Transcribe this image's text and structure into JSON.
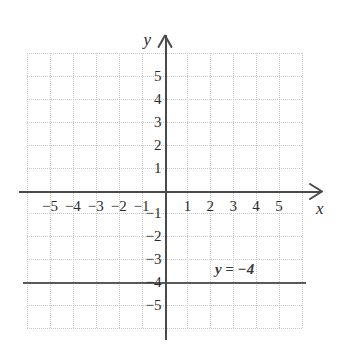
{
  "chart_data": {
    "type": "line",
    "title": "",
    "xlabel": "x",
    "ylabel": "y",
    "xlim": [
      -6,
      6
    ],
    "ylim": [
      -6,
      6
    ],
    "grid": true,
    "legend": "none",
    "x_tick_labels": [
      "−5",
      "−4",
      "−3",
      "−2",
      "−1",
      "1",
      "2",
      "3",
      "4",
      "5"
    ],
    "x_tick_values": [
      -5,
      -4,
      -3,
      -2,
      -1,
      1,
      2,
      3,
      4,
      5
    ],
    "y_tick_labels": [
      "5",
      "4",
      "3",
      "2",
      "1",
      "−1",
      "−2",
      "−3",
      "−4",
      "−5"
    ],
    "y_tick_values": [
      5,
      4,
      3,
      2,
      1,
      -1,
      -2,
      -3,
      -4,
      -5
    ],
    "series": [
      {
        "name": "y = −4",
        "equation": "y = −4",
        "annotation": "y = −4",
        "kind": "horizontal-line",
        "constant_y": -4,
        "x": [
          -6,
          6
        ],
        "values": [
          -4,
          -4
        ],
        "color": "#5a5a5a"
      }
    ],
    "axis_color": "#4a4a4a",
    "grid_color": "#c9c9c9",
    "background": "#ffffff"
  },
  "axes": {
    "x_name": "x",
    "y_name": "y"
  },
  "annotations": {
    "line_equation": "y = −4"
  }
}
